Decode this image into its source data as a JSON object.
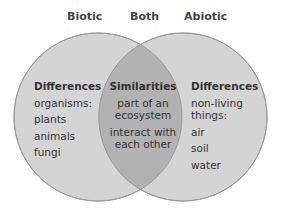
{
  "headers": {
    "left": "Biotic",
    "middle": "Both",
    "right": "Abiotic"
  },
  "left": {
    "title": "Differences",
    "items": [
      "organisms:",
      "plants",
      "animals",
      "fungi"
    ]
  },
  "middle": {
    "title": "Similarities",
    "items": [
      "part of an ecosystem",
      "interact with each other"
    ]
  },
  "right": {
    "title": "Differences",
    "items": [
      "non-living things:",
      "air",
      "soil",
      "water"
    ]
  },
  "colors": {
    "circle_fill": "#d4d4d4",
    "overlap_fill": "#b2b2b2",
    "stroke": "#9a9a9a"
  }
}
